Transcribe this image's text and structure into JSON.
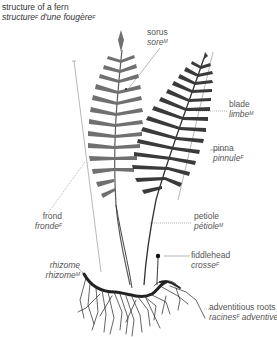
{
  "title": {
    "en": "structure of a fern",
    "fr_word1": "structure",
    "fr_sup1": "F",
    "fr_mid": " d'une ",
    "fr_word2": "fougère",
    "fr_sup2": "F"
  },
  "labels": {
    "sorus": {
      "en": "sorus",
      "fr": "sore",
      "gender": "M"
    },
    "blade": {
      "en": "blade",
      "fr": "limbe",
      "gender": "M"
    },
    "pinna": {
      "en": "pinna",
      "fr": "pinnule",
      "gender": "F"
    },
    "petiole": {
      "en": "petiole",
      "fr": "pétiole",
      "gender": "M"
    },
    "fiddlehead": {
      "en": "fiddlehead",
      "fr": "crosse",
      "gender": "F"
    },
    "adventitious_roots": {
      "en": "adventitious roots",
      "fr1": "racines",
      "gender": "F",
      "fr2": " adventives"
    },
    "frond": {
      "en": "frond",
      "fr": "fronde",
      "gender": "F"
    },
    "rhizome": {
      "en": "rhizome",
      "fr": "rhizome",
      "gender": "M"
    }
  },
  "colors": {
    "front_frond": "#3a3a3a",
    "back_frond": "#6e6e6e",
    "leader": "#9a9a9a",
    "text": "#555555"
  }
}
